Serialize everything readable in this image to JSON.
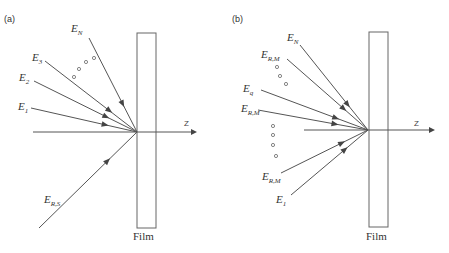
{
  "panels": [
    {
      "label": "(a)",
      "film_label": "Film",
      "axis_label": "Z",
      "rays": [
        {
          "name": "E_N",
          "main": "E",
          "sub": "N",
          "direction": "incident"
        },
        {
          "name": "E_3",
          "main": "E",
          "sub": "3",
          "direction": "incident"
        },
        {
          "name": "E_2",
          "main": "E",
          "sub": "2",
          "direction": "incident"
        },
        {
          "name": "E_1",
          "main": "E",
          "sub": "1",
          "direction": "incident"
        },
        {
          "name": "E_R,S",
          "main": "E",
          "sub": "R,S",
          "direction": "incident"
        }
      ],
      "ellipsis_dots": 4
    },
    {
      "label": "(b)",
      "film_label": "Film",
      "axis_label": "Z",
      "rays": [
        {
          "name": "E_N",
          "main": "E",
          "sub": "N",
          "direction": "incident"
        },
        {
          "name": "E_R,M_upper",
          "main": "E",
          "sub": "R,M",
          "direction": "incident"
        },
        {
          "name": "E_q",
          "main": "E",
          "sub": "q",
          "direction": "incident"
        },
        {
          "name": "E_R,M_mid",
          "main": "E",
          "sub": "R,M",
          "direction": "incident"
        },
        {
          "name": "E_R,M_lower",
          "main": "E",
          "sub": "R,M",
          "direction": "incident"
        },
        {
          "name": "E_1",
          "main": "E",
          "sub": "1",
          "direction": "incident"
        }
      ],
      "ellipsis_dots_upper": 3,
      "ellipsis_dots_lower": 4
    }
  ]
}
